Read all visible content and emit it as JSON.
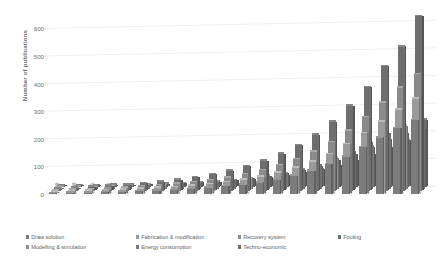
{
  "chart_data": {
    "type": "bar",
    "title": "",
    "subtitle": "",
    "xlabel": "",
    "ylabel": "Number of publications",
    "ylim": [
      0,
      630
    ],
    "yticks": [
      0,
      100,
      200,
      300,
      400,
      500,
      600
    ],
    "ytick_labels": [
      "0",
      "100",
      "200",
      "300",
      "400",
      "500",
      "600"
    ],
    "grid": true,
    "grid_axis": "y",
    "three_d": true,
    "legend_position": "bottom",
    "categories": [
      "1999",
      "2000",
      "2001",
      "2002",
      "2003",
      "2004",
      "2005",
      "2006",
      "2007",
      "2008",
      "2009",
      "2010",
      "2011",
      "2012",
      "2013",
      "2014",
      "2015",
      "2016",
      "2017",
      "2018",
      "2019",
      "2020"
    ],
    "series": [
      {
        "name": "Draw solution",
        "color": "#7c7c7c",
        "values": [
          2,
          4,
          5,
          6,
          8,
          10,
          12,
          14,
          18,
          22,
          28,
          34,
          42,
          52,
          66,
          84,
          108,
          135,
          170,
          205,
          238,
          268
        ]
      },
      {
        "name": "Fabrication & modification",
        "color": "#9a9a9a",
        "values": [
          3,
          5,
          7,
          9,
          11,
          14,
          17,
          20,
          25,
          31,
          38,
          47,
          58,
          72,
          90,
          112,
          140,
          175,
          215,
          258,
          300,
          340
        ]
      },
      {
        "name": "Recovery system",
        "color": "#8a8a8a",
        "values": [
          4,
          6,
          8,
          11,
          14,
          18,
          22,
          27,
          33,
          41,
          50,
          62,
          76,
          94,
          116,
          144,
          178,
          220,
          268,
          320,
          375,
          425
        ]
      },
      {
        "name": "Fouling",
        "color": "#6e6e6e",
        "values": [
          5,
          8,
          11,
          15,
          19,
          24,
          30,
          37,
          46,
          57,
          70,
          86,
          106,
          131,
          162,
          200,
          248,
          305,
          372,
          448,
          520,
          630
        ]
      },
      {
        "name": "Modelling & simulation",
        "color": "#8f8f8f",
        "values": [
          2,
          3,
          5,
          6,
          8,
          10,
          13,
          16,
          20,
          25,
          31,
          38,
          47,
          58,
          72,
          90,
          112,
          138,
          168,
          200,
          228,
          240
        ]
      },
      {
        "name": "Energy consumption",
        "color": "#787878",
        "values": [
          2,
          3,
          4,
          5,
          7,
          9,
          11,
          14,
          17,
          21,
          26,
          33,
          41,
          51,
          63,
          78,
          97,
          120,
          147,
          175,
          198,
          212
        ]
      },
      {
        "name": "Techno-economic",
        "color": "#6a6a6a",
        "values": [
          1,
          2,
          3,
          4,
          5,
          6,
          8,
          10,
          13,
          16,
          20,
          25,
          31,
          39,
          49,
          61,
          76,
          94,
          116,
          140,
          165,
          240
        ]
      }
    ]
  },
  "legend": {
    "items": [
      {
        "label": "Draw solution",
        "color": "#7c7c7c"
      },
      {
        "label": "Fabrication & modification",
        "color": "#9a9a9a"
      },
      {
        "label": "Recovery system",
        "color": "#8a8a8a"
      },
      {
        "label": "Fouling",
        "color": "#6e6e6e"
      },
      {
        "label": "Modelling & simulation",
        "color": "#8f8f8f"
      },
      {
        "label": "Energy consumption",
        "color": "#787878"
      },
      {
        "label": "Techno-economic",
        "color": "#6a6a6a"
      }
    ]
  },
  "style": {
    "background": "#ffffff",
    "gridline_color": "#e2e2e2",
    "axis_text_color": "#6e6e6e",
    "axis_title_color": "#6b6b6b"
  }
}
